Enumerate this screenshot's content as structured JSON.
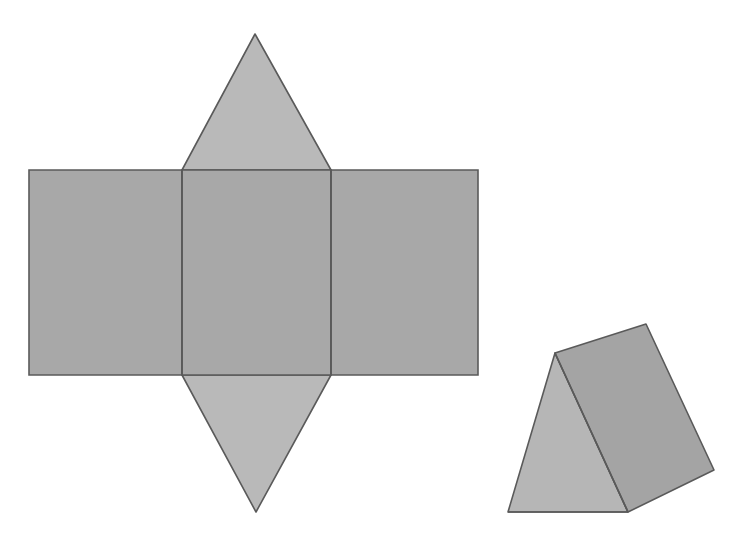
{
  "figure": {
    "title": "Net of a triangular prism and the assembled solid",
    "background_color": "#ffffff",
    "canvas": {
      "width": 738,
      "height": 537
    }
  },
  "palette": {
    "rectangle_fill": "#a8a8a8",
    "triangle_fill": "#b9b9b9",
    "solid_front_triangle_fill": "#b6b6b6",
    "solid_lateral_rect_fill": "#a4a4a4",
    "stroke": "#5a5a5a",
    "stroke_width": "1.6"
  },
  "net": {
    "label": "triangular-prism-net",
    "geometry": {
      "left_x": 29,
      "fold_x_1": 182,
      "fold_x_2": 331,
      "right_x": 478,
      "top_y": 170,
      "bottom_y": 375,
      "top_apex": {
        "x": 255,
        "y": 34
      },
      "bottom_apex": {
        "x": 256,
        "y": 512
      }
    },
    "faces": [
      {
        "name": "left-rectangle-face",
        "shape": "rectangle",
        "points": "29,170 182,170 182,375 29,375"
      },
      {
        "name": "middle-rectangle-face",
        "shape": "rectangle",
        "points": "182,170 331,170 331,375 182,375"
      },
      {
        "name": "right-rectangle-face",
        "shape": "rectangle",
        "points": "331,170 478,170 478,375 331,375"
      },
      {
        "name": "top-triangle-face",
        "shape": "triangle",
        "points": "182,170 255,34 331,170"
      },
      {
        "name": "bottom-triangle-face",
        "shape": "triangle",
        "points": "182,375 256,512 331,375"
      }
    ],
    "fold_lines": [
      {
        "name": "fold-line-left",
        "points": "182,170 182,375"
      },
      {
        "name": "fold-line-right",
        "points": "331,170 331,375"
      }
    ]
  },
  "solid": {
    "label": "triangular-prism-solid",
    "faces": [
      {
        "name": "solid-triangular-end-face",
        "shape": "triangle",
        "points": "555,353 508,512 628,512"
      },
      {
        "name": "solid-lateral-rectangle-face",
        "shape": "quadrilateral",
        "points": "555,353 646,324 714,470 628,512"
      }
    ],
    "edges": [
      {
        "name": "solid-ridge-edge",
        "points": "555,353 628,512"
      },
      {
        "name": "solid-base-front-edge",
        "points": "508,512 628,512"
      }
    ]
  }
}
